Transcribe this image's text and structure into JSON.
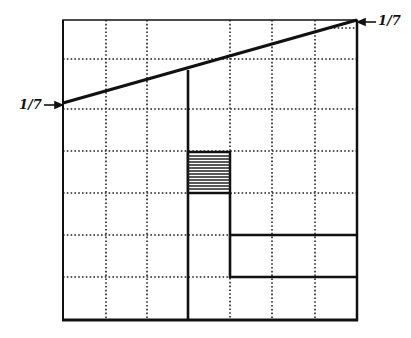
{
  "diagram": {
    "grid": {
      "columns": 7,
      "rows": 7
    },
    "labels": {
      "left": "1/7",
      "right": "1/7"
    },
    "colors": {
      "line": "#111111",
      "grid": "#222222",
      "background": "#ffffff",
      "hatch": "#222222"
    }
  }
}
